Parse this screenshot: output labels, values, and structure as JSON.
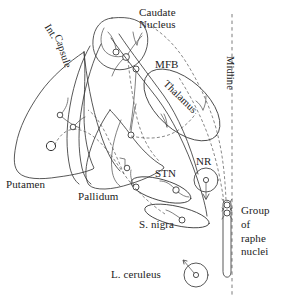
{
  "figure": {
    "background_color": "#ffffff",
    "ink_color": "#333333"
  },
  "labels": {
    "caudate_nucleus": "Caudate\nNucleus",
    "internal_capsule_line1": "Int.",
    "internal_capsule_line2": "Capsule",
    "mfb": "MFB",
    "thalamus": "Thalamus",
    "midline": "Midline",
    "putamen": "Putamen",
    "pallidum": "Pallidum",
    "stn": "STN",
    "substantia_nigra": "S. nigra",
    "nucleus_raphe": "NR",
    "group_of_raphe_nuclei": "Group\nof\nraphe\nnuclei",
    "locus_ceruleus": "L. ceruleus"
  },
  "structures": [
    {
      "name": "putamen",
      "label": "Putamen",
      "shape": "leaf-outline"
    },
    {
      "name": "caudate-nucleus",
      "label": "Caudate Nucleus",
      "shape": "teardrop-outline"
    },
    {
      "name": "internal-capsule",
      "label": "Int. Capsule",
      "shape": "band-outline"
    },
    {
      "name": "thalamus",
      "label": "Thalamus",
      "shape": "tilted-ellipse"
    },
    {
      "name": "pallidum",
      "label": "Pallidum",
      "shape": "wedge-outline"
    },
    {
      "name": "subthalamic-nucleus",
      "label": "STN",
      "shape": "elongated-ellipse"
    },
    {
      "name": "substantia-nigra",
      "label": "S. nigra",
      "shape": "elongated-ellipse"
    },
    {
      "name": "nucleus-raphe",
      "label": "NR",
      "shape": "circle-with-soma"
    },
    {
      "name": "group-of-raphe-nuclei",
      "label": "Group of raphe nuclei",
      "shape": "elongated-capsule"
    },
    {
      "name": "locus-ceruleus",
      "label": "L. ceruleus",
      "shape": "circle-with-soma"
    },
    {
      "name": "medial-forebrain-bundle",
      "label": "MFB",
      "shape": "fiber-tract"
    },
    {
      "name": "midline",
      "label": "Midline",
      "shape": "vertical-dashed-line"
    }
  ],
  "neuron_count": 14,
  "pathway_styles": {
    "solid": "axon / structure outline",
    "dashed": "projection pathway"
  }
}
